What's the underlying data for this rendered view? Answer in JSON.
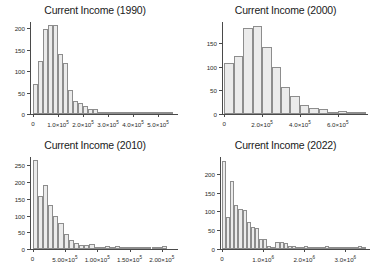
{
  "chart_data": [
    {
      "type": "bar",
      "title": "Current Income (1990)",
      "xlabel": "",
      "ylabel": "",
      "grid": false,
      "legend": null,
      "ylim": [
        0,
        215
      ],
      "xlim": [
        -12000,
        580000
      ],
      "yticks": [
        0,
        50,
        100,
        150,
        200
      ],
      "ytick_labels": [
        "0",
        "50",
        "100",
        "150",
        "200"
      ],
      "xticks": [
        0,
        100000,
        200000,
        300000,
        400000,
        500000
      ],
      "xtick_labels": [
        "0",
        "1.0×10",
        "2.0×10",
        "3.0×10",
        "4.0×10",
        "5.0×10"
      ],
      "xtick_exponent": "5",
      "bin_width": 20000,
      "bin_starts": [
        0,
        20000,
        40000,
        60000,
        80000,
        100000,
        120000,
        140000,
        160000,
        180000,
        200000,
        220000,
        240000,
        260000,
        280000,
        300000,
        320000,
        340000,
        360000,
        380000,
        400000,
        420000,
        440000,
        460000,
        480000,
        500000,
        520000,
        540000
      ],
      "values": [
        69,
        124,
        199,
        209,
        209,
        141,
        120,
        56,
        30,
        26,
        19,
        12,
        12,
        3,
        2,
        4,
        1,
        1,
        4,
        1,
        1,
        4,
        1,
        1,
        1,
        1,
        1,
        5
      ]
    },
    {
      "type": "bar",
      "title": "Current Income (2000)",
      "xlabel": "",
      "ylabel": "",
      "grid": false,
      "legend": null,
      "ylim": [
        0,
        195
      ],
      "xlim": [
        -12000,
        760000
      ],
      "yticks": [
        0,
        50,
        100,
        150
      ],
      "ytick_labels": [
        "0",
        "50",
        "100",
        "150"
      ],
      "xticks": [
        0,
        200000,
        400000,
        600000
      ],
      "xtick_labels": [
        "0",
        "2.0×10",
        "4.0×10",
        "6.0×10"
      ],
      "xtick_exponent": "5",
      "bin_width": 50000,
      "bin_starts": [
        0,
        50000,
        100000,
        150000,
        200000,
        250000,
        300000,
        350000,
        400000,
        450000,
        500000,
        550000,
        600000,
        650000,
        700000
      ],
      "values": [
        108,
        122,
        183,
        187,
        143,
        99,
        57,
        39,
        20,
        12,
        11,
        5,
        6,
        5,
        1
      ]
    },
    {
      "type": "bar",
      "title": "Current Income (2010)",
      "xlabel": "",
      "ylabel": "",
      "grid": false,
      "legend": null,
      "ylim": [
        0,
        275
      ],
      "xlim": [
        -40000,
        2250000
      ],
      "yticks": [
        0,
        50,
        100,
        150,
        200,
        250
      ],
      "ytick_labels": [
        "0",
        "50",
        "100",
        "150",
        "200",
        "250"
      ],
      "xticks": [
        0,
        500000,
        1000000,
        1500000,
        2000000
      ],
      "xtick_labels": [
        "0",
        "5.00×10",
        "1.00×10",
        "1.50×10",
        "2.00×10"
      ],
      "xtick_exponent": "5",
      "bin_width": 80000,
      "bin_starts": [
        0,
        80000,
        160000,
        240000,
        320000,
        400000,
        480000,
        560000,
        640000,
        720000,
        800000,
        880000,
        960000,
        1040000,
        1120000,
        1200000,
        1280000,
        1360000,
        1440000,
        1520000,
        1600000,
        1680000,
        1760000,
        1840000,
        1920000,
        2000000
      ],
      "values": [
        265,
        158,
        192,
        131,
        98,
        78,
        46,
        27,
        18,
        11,
        11,
        16,
        1,
        1,
        10,
        1,
        10,
        1,
        1,
        1,
        1,
        1,
        1,
        1,
        1,
        10
      ]
    },
    {
      "type": "bar",
      "title": "Current Income (2022)",
      "xlabel": "",
      "ylabel": "",
      "grid": false,
      "legend": null,
      "ylim": [
        0,
        245
      ],
      "xlim": [
        -50000,
        3600000
      ],
      "yticks": [
        0,
        50,
        100,
        150,
        200
      ],
      "ytick_labels": [
        "0",
        "50",
        "100",
        "150",
        "200"
      ],
      "xticks": [
        0,
        1000000,
        2000000,
        3000000
      ],
      "xtick_labels": [
        "0",
        "1.0×10",
        "2.0×10",
        "3.0×10"
      ],
      "xtick_exponent": "6",
      "bin_width": 100000,
      "bin_starts": [
        0,
        100000,
        200000,
        300000,
        400000,
        500000,
        600000,
        700000,
        800000,
        900000,
        1000000,
        1100000,
        1200000,
        1300000,
        1400000,
        1500000,
        1600000,
        1700000,
        1800000,
        1900000,
        2000000,
        2100000,
        2200000,
        2300000,
        2400000,
        2500000,
        2600000,
        2700000,
        2800000,
        2900000,
        3000000,
        3100000,
        3200000,
        3300000,
        3400000
      ],
      "values": [
        235,
        85,
        180,
        117,
        106,
        103,
        73,
        58,
        55,
        27,
        28,
        7,
        6,
        18,
        18,
        17,
        9,
        8,
        3,
        3,
        9,
        2,
        2,
        2,
        2,
        9,
        1,
        1,
        1,
        1,
        1,
        1,
        1,
        9,
        1
      ]
    }
  ]
}
